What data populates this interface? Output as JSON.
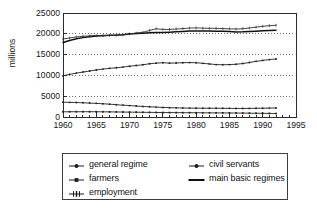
{
  "chart_data": {
    "type": "line",
    "title": "",
    "subtitle": "",
    "xlabel": "",
    "ylabel": "millions",
    "xlim": [
      1960,
      1995
    ],
    "ylim": [
      0,
      25000
    ],
    "grid": "horizontal-dotted",
    "legend_position": "bottom-outside",
    "legend_columns": 2,
    "x_ticks": [
      1960,
      1965,
      1970,
      1975,
      1980,
      1985,
      1990,
      1995
    ],
    "x_tick_labels": [
      "1960",
      "1965",
      "1970",
      "1975",
      "1980",
      "1985",
      "1990",
      "1995"
    ],
    "x_minor_tick_interval": 1,
    "y_ticks": [
      0,
      5000,
      10000,
      15000,
      20000,
      25000
    ],
    "y_tick_labels": [
      "0",
      "5000",
      "10000",
      "15000",
      "20000",
      "25000"
    ],
    "x": [
      1960,
      1961,
      1962,
      1963,
      1964,
      1965,
      1966,
      1967,
      1968,
      1969,
      1970,
      1971,
      1972,
      1973,
      1974,
      1975,
      1976,
      1977,
      1978,
      1979,
      1980,
      1981,
      1982,
      1983,
      1984,
      1985,
      1986,
      1987,
      1988,
      1989,
      1990,
      1991,
      1992
    ],
    "series": [
      {
        "name": "general regime",
        "marker": "line-dot",
        "color": "#202020",
        "values": [
          9900,
          10250,
          10550,
          10800,
          11050,
          11300,
          11520,
          11700,
          11830,
          12000,
          12200,
          12380,
          12560,
          12800,
          12950,
          13050,
          12950,
          12980,
          13050,
          13080,
          13050,
          12900,
          12750,
          12600,
          12560,
          12600,
          12680,
          12850,
          13100,
          13380,
          13600,
          13800,
          13950
        ]
      },
      {
        "name": "civil servants",
        "marker": "line-dot",
        "color": "#202020",
        "values": [
          3550,
          3520,
          3480,
          3420,
          3350,
          3280,
          3180,
          3080,
          2960,
          2850,
          2740,
          2640,
          2540,
          2450,
          2380,
          2300,
          2240,
          2200,
          2160,
          2140,
          2120,
          2110,
          2100,
          2100,
          2090,
          2080,
          2060,
          2060,
          2070,
          2090,
          2110,
          2140,
          2180
        ]
      },
      {
        "name": "farmers",
        "marker": "line-square",
        "color": "#202020",
        "values": [
          1250,
          1260,
          1265,
          1270,
          1270,
          1260,
          1250,
          1230,
          1210,
          1190,
          1170,
          1150,
          1130,
          1110,
          1090,
          1070,
          1060,
          1050,
          1040,
          1030,
          1020,
          1010,
          1000,
          990,
          980,
          970,
          955,
          940,
          920,
          900,
          880,
          855,
          830
        ]
      },
      {
        "name": "main basic regimes",
        "marker": "plain-line",
        "color": "#101010",
        "values": [
          17900,
          18400,
          18800,
          19080,
          19300,
          19450,
          19560,
          19640,
          19700,
          19800,
          19950,
          20050,
          20150,
          20250,
          20300,
          20300,
          20380,
          20480,
          20560,
          20650,
          20700,
          20680,
          20650,
          20620,
          20600,
          20560,
          20450,
          20480,
          20560,
          20640,
          20720,
          20780,
          20830
        ]
      },
      {
        "name": "employment",
        "marker": "line-plus",
        "color": "#303030",
        "values": [
          18750,
          19000,
          19250,
          19400,
          19500,
          19560,
          19600,
          19600,
          19650,
          19780,
          19980,
          20180,
          20350,
          20800,
          21200,
          21050,
          21050,
          21150,
          21250,
          21380,
          21420,
          21350,
          21320,
          21300,
          21250,
          21200,
          21150,
          21220,
          21400,
          21600,
          21800,
          21950,
          22050
        ]
      }
    ]
  },
  "axes": {
    "ylabel": "millions"
  },
  "legend": {
    "items": [
      {
        "label": "general regime",
        "marker": "line-dot",
        "column": "left"
      },
      {
        "label": "farmers",
        "marker": "line-square",
        "column": "left"
      },
      {
        "label": "employment",
        "marker": "line-plus",
        "column": "left"
      },
      {
        "label": "civil servants",
        "marker": "line-dot",
        "column": "right"
      },
      {
        "label": "main basic regimes",
        "marker": "plain-line",
        "column": "right"
      }
    ]
  },
  "colors": {
    "axis": "#2b2b2b",
    "grid": "#4a4a4a",
    "text": "#161616",
    "background": "#ffffff"
  }
}
